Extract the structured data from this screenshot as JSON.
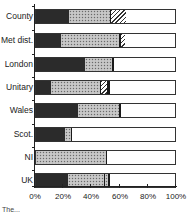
{
  "chart_data": {
    "type": "bar",
    "orientation": "horizontal",
    "stacked": "100%",
    "title": "",
    "xlabel": "",
    "ylabel": "",
    "xlim": [
      0,
      100
    ],
    "x_ticks": [
      "0%",
      "20%",
      "40%",
      "60%",
      "80%",
      "100%"
    ],
    "grid": false,
    "legend": null,
    "categories": [
      "County",
      "Met dist.",
      "London",
      "Unitary",
      "Wales",
      "Scot.",
      "NI",
      "UK"
    ],
    "bars": [
      {
        "category": "County",
        "segments": [
          {
            "pattern": "dark",
            "value": 24
          },
          {
            "pattern": "dotted",
            "value": 29
          },
          {
            "pattern": "sep",
            "value": 1
          },
          {
            "pattern": "hatch",
            "value": 11
          },
          {
            "pattern": "white",
            "value": 35
          }
        ]
      },
      {
        "category": "Met dist.",
        "segments": [
          {
            "pattern": "dark",
            "value": 18
          },
          {
            "pattern": "dotted",
            "value": 42
          },
          {
            "pattern": "sep",
            "value": 1
          },
          {
            "pattern": "hatch",
            "value": 3
          },
          {
            "pattern": "white",
            "value": 36
          }
        ]
      },
      {
        "category": "London",
        "segments": [
          {
            "pattern": "dark",
            "value": 35
          },
          {
            "pattern": "dotted",
            "value": 20
          },
          {
            "pattern": "sep",
            "value": 1
          },
          {
            "pattern": "white",
            "value": 44
          }
        ]
      },
      {
        "category": "Unitary",
        "segments": [
          {
            "pattern": "dark",
            "value": 11
          },
          {
            "pattern": "dotted",
            "value": 35
          },
          {
            "pattern": "sep",
            "value": 1
          },
          {
            "pattern": "hatch",
            "value": 4
          },
          {
            "pattern": "sep",
            "value": 2
          },
          {
            "pattern": "white",
            "value": 47
          }
        ]
      },
      {
        "category": "Wales",
        "segments": [
          {
            "pattern": "dark",
            "value": 30
          },
          {
            "pattern": "dotted",
            "value": 30
          },
          {
            "pattern": "sep",
            "value": 1
          },
          {
            "pattern": "white",
            "value": 39
          }
        ]
      },
      {
        "category": "Scot.",
        "segments": [
          {
            "pattern": "dark",
            "value": 21
          },
          {
            "pattern": "dotted",
            "value": 4
          },
          {
            "pattern": "sep",
            "value": 1
          },
          {
            "pattern": "white",
            "value": 74
          }
        ]
      },
      {
        "category": "NI",
        "segments": [
          {
            "pattern": "dotted",
            "value": 50
          },
          {
            "pattern": "sep",
            "value": 1
          },
          {
            "pattern": "white",
            "value": 49
          }
        ]
      },
      {
        "category": "UK",
        "segments": [
          {
            "pattern": "dark",
            "value": 23
          },
          {
            "pattern": "dotted",
            "value": 26
          },
          {
            "pattern": "sep",
            "value": 1
          },
          {
            "pattern": "dotted",
            "value": 2
          },
          {
            "pattern": "sep",
            "value": 1
          },
          {
            "pattern": "white",
            "value": 47
          }
        ]
      }
    ],
    "colors": {
      "dark": "#2b2b2b",
      "dotted": "#bdbdbd",
      "sep": "#1a1a1a",
      "hatch": "#333333",
      "white": "#ffffff"
    }
  },
  "caption": "The...",
  "layout": {
    "bar_tops": [
      9,
      33,
      57,
      80,
      103,
      127,
      150,
      173
    ]
  }
}
